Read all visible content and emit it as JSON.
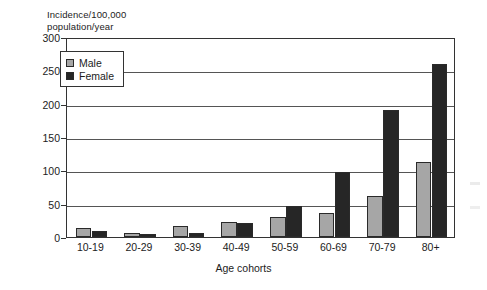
{
  "chart_data": {
    "type": "bar",
    "title": "",
    "ylabel": "Incidence/100,000\npopulation/year",
    "xlabel": "Age cohorts",
    "categories": [
      "10-19",
      "20-29",
      "30-39",
      "40-49",
      "50-59",
      "60-69",
      "70-79",
      "80+"
    ],
    "series": [
      {
        "name": "Male",
        "color": "#a6a6a6",
        "values": [
          13,
          6,
          17,
          22,
          30,
          36,
          61,
          112
        ]
      },
      {
        "name": "Female",
        "color": "#262626",
        "values": [
          9,
          4,
          6,
          21,
          47,
          98,
          191,
          260
        ]
      }
    ],
    "ylim": [
      0,
      300
    ],
    "yticks": [
      0,
      50,
      100,
      150,
      200,
      250,
      300
    ],
    "grid": true,
    "legend_position": "upper-left-inside"
  },
  "legend": {
    "items": [
      {
        "label": "Male"
      },
      {
        "label": "Female"
      }
    ]
  },
  "axes": {
    "y_title": "Incidence/100,000\npopulation/year",
    "x_title": "Age cohorts"
  }
}
